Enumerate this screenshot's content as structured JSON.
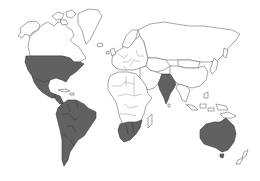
{
  "map": {
    "type": "world-choropleth",
    "projection": "robinson-like",
    "style": "outline map, grayscale",
    "colors": {
      "background": "#ffffff",
      "land_fill": "#ffffff",
      "land_stroke": "#6a6a6a",
      "highlight_fill": "#616161"
    },
    "highlighted_regions": [
      "United States",
      "Mexico",
      "Central America",
      "Colombia",
      "Venezuela",
      "Guyana",
      "Suriname",
      "French Guiana",
      "Ecuador",
      "Peru",
      "Brazil",
      "Bolivia",
      "Paraguay",
      "Chile",
      "Argentina",
      "Uruguay",
      "India",
      "Namibia",
      "Botswana",
      "South Africa",
      "Zimbabwe",
      "Mozambique (southern)",
      "Australia"
    ],
    "unhighlighted_regions": [
      "Canada",
      "Alaska",
      "Greenland",
      "Caribbean",
      "Europe",
      "Russia",
      "Middle East",
      "Central Asia",
      "China",
      "Mongolia",
      "Japan",
      "Southeast Asia",
      "Indonesia",
      "Northern and Central Africa",
      "Madagascar",
      "New Zealand"
    ],
    "legend": null,
    "title": null
  }
}
